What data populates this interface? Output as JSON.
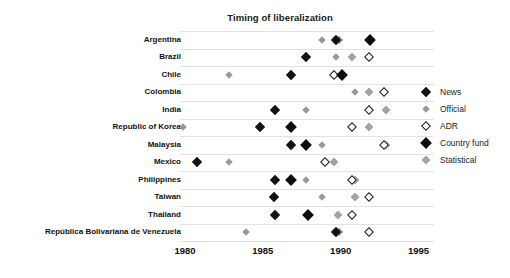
{
  "chart_data": {
    "type": "scatter",
    "title": "Timing of liberalization",
    "xlabel": "",
    "ylabel": "",
    "xlim": [
      1980,
      1996
    ],
    "xticks": [
      1980,
      1985,
      1990,
      1995
    ],
    "xtick_labels": [
      "1980",
      "1985",
      "1990",
      "1995"
    ],
    "grid": true,
    "legend_position": "right",
    "categories": [
      "Argentina",
      "Brazil",
      "Chile",
      "Colombia",
      "India",
      "Republic of Korea",
      "Malaysia",
      "Mexico",
      "Philippines",
      "Taiwan",
      "Thailand",
      "República Bolivariana de Venezuela"
    ],
    "series": [
      {
        "name": "News",
        "marker": "filled-diamond",
        "color": "#141414",
        "points": [
          {
            "category": "Argentina",
            "x": 1989.7
          },
          {
            "category": "Brazil",
            "x": 1987.8
          },
          {
            "category": "Chile",
            "x": 1986.8
          },
          {
            "category": "India",
            "x": 1985.8
          },
          {
            "category": "Republic of Korea",
            "x": 1984.8
          },
          {
            "category": "Malaysia",
            "x": 1986.8
          },
          {
            "category": "Mexico",
            "x": 1980.8
          },
          {
            "category": "Philippines",
            "x": 1985.8
          },
          {
            "category": "Taiwan",
            "x": 1985.7
          },
          {
            "category": "Thailand",
            "x": 1985.8
          },
          {
            "category": "República Bolivariana de Venezuela",
            "x": 1989.7
          }
        ]
      },
      {
        "name": "Official",
        "marker": "small-gray-diamond",
        "color": "#9a9a9a",
        "points": [
          {
            "category": "Argentina",
            "x": 1988.8
          },
          {
            "category": "Brazil",
            "x": 1989.7
          },
          {
            "category": "Chile",
            "x": 1982.8
          },
          {
            "category": "Colombia",
            "x": 1990.9
          },
          {
            "category": "India",
            "x": 1987.8
          },
          {
            "category": "Republic of Korea",
            "x": 1979.9
          },
          {
            "category": "Malaysia",
            "x": 1988.8
          },
          {
            "category": "Mexico",
            "x": 1982.8
          },
          {
            "category": "Philippines",
            "x": 1987.8
          },
          {
            "category": "Taiwan",
            "x": 1988.8
          },
          {
            "category": "Thailand",
            "x": 1987.9
          },
          {
            "category": "República Bolivariana de Venezuela",
            "x": 1983.9
          }
        ]
      },
      {
        "name": "ADR",
        "marker": "open-diamond",
        "color": "#ffffff",
        "points": [
          {
            "category": "Brazil",
            "x": 1991.8
          },
          {
            "category": "Chile",
            "x": 1989.6
          },
          {
            "category": "Colombia",
            "x": 1992.8
          },
          {
            "category": "India",
            "x": 1991.8
          },
          {
            "category": "Republic of Korea",
            "x": 1990.7
          },
          {
            "category": "Malaysia",
            "x": 1992.8
          },
          {
            "category": "Mexico",
            "x": 1989.0
          },
          {
            "category": "Philippines",
            "x": 1990.7
          },
          {
            "category": "Taiwan",
            "x": 1991.8
          },
          {
            "category": "Thailand",
            "x": 1990.7
          },
          {
            "category": "República Bolivariana de Venezuela",
            "x": 1991.8
          }
        ]
      },
      {
        "name": "Country fund",
        "marker": "large-filled-diamond",
        "color": "#0d0d0d",
        "points": [
          {
            "category": "Argentina",
            "x": 1991.9
          },
          {
            "category": "Chile",
            "x": 1990.1
          },
          {
            "category": "Republic of Korea",
            "x": 1986.8
          },
          {
            "category": "Malaysia",
            "x": 1987.8
          },
          {
            "category": "Philippines",
            "x": 1986.8
          },
          {
            "category": "Thailand",
            "x": 1987.9
          }
        ]
      },
      {
        "name": "Statistical",
        "marker": "medium-gray-diamond",
        "color": "#a3a3a3",
        "points": [
          {
            "category": "Argentina",
            "x": 1989.9
          },
          {
            "category": "Brazil",
            "x": 1990.7
          },
          {
            "category": "Colombia",
            "x": 1991.8
          },
          {
            "category": "India",
            "x": 1992.9
          },
          {
            "category": "Republic of Korea",
            "x": 1991.8
          },
          {
            "category": "Malaysia",
            "x": 1992.9
          },
          {
            "category": "Mexico",
            "x": 1989.6
          },
          {
            "category": "Philippines",
            "x": 1990.9
          },
          {
            "category": "Taiwan",
            "x": 1990.9
          },
          {
            "category": "Thailand",
            "x": 1989.8
          },
          {
            "category": "República Bolivariana de Venezuela",
            "x": 1989.9
          }
        ]
      }
    ]
  },
  "legend": {
    "items": [
      {
        "label": "News",
        "marker": "filled-diamond"
      },
      {
        "label": "Official",
        "marker": "small-gray-diamond"
      },
      {
        "label": "ADR",
        "marker": "open-diamond"
      },
      {
        "label": "Country fund",
        "marker": "large-filled-diamond"
      },
      {
        "label": "Statistical",
        "marker": "medium-gray-diamond"
      }
    ]
  }
}
